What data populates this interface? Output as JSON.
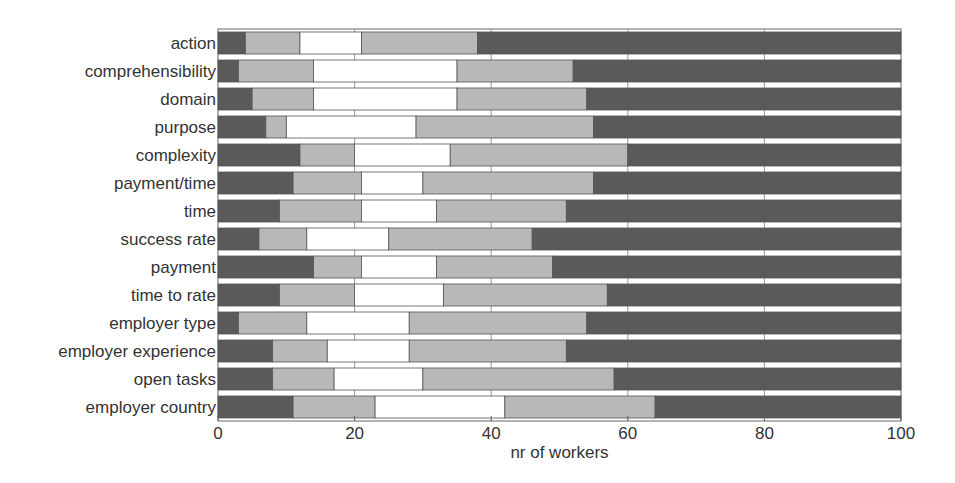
{
  "chart_data": {
    "type": "bar",
    "orientation": "horizontal",
    "stacked": true,
    "title": "",
    "xlabel": "nr of workers",
    "ylabel": "",
    "xlim": [
      0,
      100
    ],
    "xticks": [
      0,
      20,
      40,
      60,
      80,
      100
    ],
    "grid": true,
    "legend": null,
    "categories": [
      "action",
      "comprehensibility",
      "domain",
      "purpose",
      "complexity",
      "payment/time",
      "time",
      "success rate",
      "payment",
      "time to rate",
      "employer type",
      "employer experience",
      "open tasks",
      "employer country"
    ],
    "series": [
      {
        "name": "segment 1",
        "color": "#5a5a5a",
        "values": [
          4,
          3,
          5,
          7,
          12,
          11,
          9,
          6,
          14,
          9,
          3,
          8,
          8,
          11
        ]
      },
      {
        "name": "segment 2",
        "color": "#b8b8b8",
        "values": [
          8,
          11,
          9,
          3,
          8,
          10,
          12,
          7,
          7,
          11,
          10,
          8,
          9,
          12
        ]
      },
      {
        "name": "segment 3",
        "color": "#ffffff",
        "values": [
          9,
          21,
          21,
          19,
          14,
          9,
          11,
          12,
          11,
          13,
          15,
          12,
          13,
          19
        ]
      },
      {
        "name": "segment 4",
        "color": "#b8b8b8",
        "values": [
          17,
          17,
          19,
          26,
          26,
          25,
          19,
          21,
          17,
          24,
          26,
          23,
          28,
          22
        ]
      },
      {
        "name": "segment 5",
        "color": "#5a5a5a",
        "values": [
          62,
          48,
          46,
          45,
          40,
          45,
          49,
          54,
          51,
          43,
          46,
          49,
          42,
          36
        ]
      }
    ]
  }
}
